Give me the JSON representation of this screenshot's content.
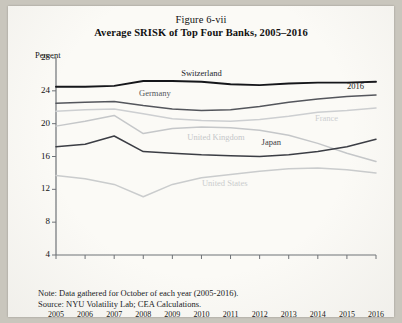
{
  "figure": {
    "number": "Figure 6-vii",
    "title": "Average SRISK of Top Four Banks, 2005–2016",
    "note": "Note: Data gathered for October of each year (2005-2016).",
    "source": "Source: NYU Volatility Lab; CEA Calculations.",
    "right_annotation": "2016"
  },
  "chart_data": {
    "type": "line",
    "title": "Average SRISK of Top Four Banks, 2005–2016",
    "subtitle": "Figure 6-vii",
    "xlabel": "",
    "ylabel": "Percent",
    "ylim": [
      4,
      28
    ],
    "yticks": [
      4,
      8,
      12,
      16,
      20,
      24,
      28
    ],
    "xlim": [
      2005,
      2016
    ],
    "grid": false,
    "legend": "inline-labels",
    "categories": [
      2005,
      2006,
      2007,
      2008,
      2009,
      2010,
      2011,
      2012,
      2013,
      2014,
      2015,
      2016
    ],
    "x": [
      "2005",
      "2006",
      "2007",
      "2008",
      "2009",
      "2010",
      "2011",
      "2012",
      "2013",
      "2014",
      "2015",
      "2016"
    ],
    "series": [
      {
        "name": "Switzerland",
        "color": "#15161a",
        "width": 1.9,
        "label_x": 2010.0,
        "label_y": 26.1,
        "values": [
          24.5,
          24.5,
          24.6,
          25.2,
          25.2,
          25.1,
          24.8,
          24.7,
          24.9,
          25.0,
          25.0,
          25.1
        ]
      },
      {
        "name": "Germany",
        "color": "#54565c",
        "width": 1.5,
        "label_x": 2008.4,
        "label_y": 23.6,
        "values": [
          22.5,
          22.6,
          22.7,
          22.2,
          21.8,
          21.6,
          21.7,
          22.1,
          22.6,
          23.0,
          23.3,
          23.5
        ]
      },
      {
        "name": "France",
        "color": "#cdcfd1",
        "width": 1.5,
        "label_x": 2014.3,
        "label_y": 20.6,
        "values": [
          21.5,
          21.7,
          21.8,
          21.2,
          20.6,
          20.4,
          20.3,
          20.5,
          20.9,
          21.4,
          21.6,
          21.9
        ]
      },
      {
        "name": "United Kingdom",
        "color": "#c5c7c9",
        "width": 1.5,
        "label_x": 2010.5,
        "label_y": 18.2,
        "values": [
          19.7,
          20.3,
          21.0,
          18.8,
          19.4,
          19.6,
          19.5,
          19.2,
          18.6,
          17.6,
          16.4,
          15.4
        ]
      },
      {
        "name": "Japan",
        "color": "#3b3d44",
        "width": 1.5,
        "label_x": 2012.4,
        "label_y": 17.6,
        "values": [
          17.2,
          17.5,
          18.5,
          16.6,
          16.4,
          16.2,
          16.1,
          16.0,
          16.2,
          16.6,
          17.2,
          18.1
        ]
      },
      {
        "name": "United States",
        "color": "#cacccd",
        "width": 1.5,
        "label_x": 2010.8,
        "label_y": 12.6,
        "values": [
          13.7,
          13.3,
          12.6,
          11.1,
          12.6,
          13.4,
          13.8,
          14.2,
          14.5,
          14.6,
          14.4,
          14.0
        ]
      }
    ]
  }
}
